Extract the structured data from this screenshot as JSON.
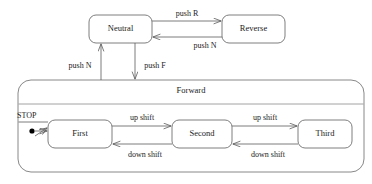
{
  "diagram": {
    "type": "state-machine",
    "canvas": {
      "width": 372,
      "height": 184
    },
    "colors": {
      "background": "#ffffff",
      "box_stroke": "#6f6f6f",
      "composite_stroke": "#7a7a7a",
      "edge_stroke": "#5a5a5a",
      "text": "#1b1b1b",
      "initial_dot": "#000000"
    },
    "states": [
      {
        "id": "neutral",
        "label": "Neutral",
        "x": 89,
        "y": 15,
        "w": 63,
        "h": 28
      },
      {
        "id": "reverse",
        "label": "Reverse",
        "x": 222,
        "y": 15,
        "w": 63,
        "h": 28
      },
      {
        "id": "first",
        "label": "First",
        "x": 48,
        "y": 120,
        "w": 64,
        "h": 28
      },
      {
        "id": "second",
        "label": "Second",
        "x": 172,
        "y": 120,
        "w": 60,
        "h": 28
      },
      {
        "id": "third",
        "label": "Third",
        "x": 298,
        "y": 120,
        "w": 54,
        "h": 28
      }
    ],
    "composite": {
      "id": "forward",
      "label": "Forward",
      "x": 18,
      "y": 80,
      "w": 346,
      "h": 92,
      "divider_y": 104
    },
    "initial": {
      "label": "STOP",
      "dot_x": 32,
      "dot_y": 131,
      "dot_r": 2.6,
      "label_x": 17,
      "label_y": 117
    },
    "transitions": [
      {
        "id": "neutral-to-reverse",
        "label": "push R",
        "from": "neutral",
        "to": "reverse",
        "label_x": 187,
        "label_y": 14
      },
      {
        "id": "reverse-to-neutral",
        "label": "push N",
        "from": "reverse",
        "to": "neutral",
        "label_x": 205,
        "label_y": 45
      },
      {
        "id": "forward-to-neutral",
        "label": "push N",
        "from": "forward",
        "to": "neutral",
        "label_x": 80,
        "label_y": 66
      },
      {
        "id": "neutral-to-forward",
        "label": "push F",
        "from": "neutral",
        "to": "forward",
        "label_x": 155,
        "label_y": 66
      },
      {
        "id": "first-to-second",
        "label": "up shift",
        "from": "first",
        "to": "second",
        "label_x": 142,
        "label_y": 118
      },
      {
        "id": "second-to-first",
        "label": "down shift",
        "from": "second",
        "to": "first",
        "label_x": 145,
        "label_y": 156
      },
      {
        "id": "second-to-third",
        "label": "up shift",
        "from": "second",
        "to": "third",
        "label_x": 265,
        "label_y": 118
      },
      {
        "id": "third-to-second",
        "label": "down shift",
        "from": "third",
        "to": "second",
        "label_x": 268,
        "label_y": 156
      }
    ]
  }
}
